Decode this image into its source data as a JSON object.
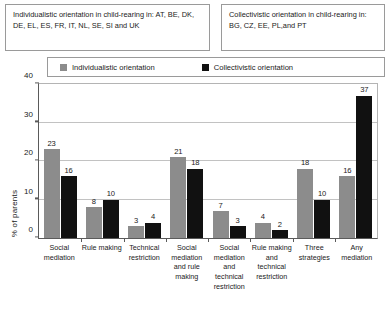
{
  "header": {
    "boxes": [
      {
        "name": "individualistic-note",
        "text": "Individualistic orientation in child-rearing in: AT, BE, DK, DE, EL, ES, FR, IT, NL, SE, SI and UK"
      },
      {
        "name": "collectivistic-note",
        "text": "Collectivistic orientation in child-rearing in: BG, CZ, EE, PL,and PT"
      }
    ]
  },
  "legend": {
    "items": [
      {
        "label": "Individualistic orientation",
        "color": "#8c8c8c"
      },
      {
        "label": "Collectivistic orientation",
        "color": "#111111"
      }
    ]
  },
  "colors": {
    "individualistic": "#8c8c8c",
    "collectivistic": "#111111",
    "axis": "#5a5a5a",
    "grid": "#c2c2c2"
  },
  "chart_data": {
    "type": "bar",
    "title": "",
    "xlabel": "",
    "ylabel": "% of parents",
    "ylim": [
      0,
      40
    ],
    "yticks": [
      0,
      10,
      20,
      30,
      40
    ],
    "grid": true,
    "legend_position": "top",
    "categories": [
      "Social mediation",
      "Rule making",
      "Technical restriction",
      "Social mediation and rule making",
      "Social mediation and technical restriction",
      "Rule making and technical restriction",
      "Three strategies",
      "Any mediation"
    ],
    "series": [
      {
        "name": "Individualistic orientation",
        "color": "#8c8c8c",
        "values": [
          23,
          8,
          3,
          21,
          7,
          4,
          18,
          16
        ]
      },
      {
        "name": "Collectivistic orientation",
        "color": "#111111",
        "values": [
          16,
          10,
          4,
          18,
          3,
          2,
          10,
          37
        ]
      }
    ]
  }
}
